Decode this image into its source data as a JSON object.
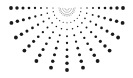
{
  "graphic": {
    "name": "half-sunburst-dot-pattern",
    "dot_color": "#1a1a1a",
    "center": [
      67,
      8
    ],
    "rays_count": 13,
    "angle_start_deg": 0,
    "angle_end_deg": 180,
    "dots_per_ray": 9,
    "radius_start": 8,
    "radius_end_horizontal": 56,
    "radius_end_vertical": 62,
    "dot_size_min": 0.4,
    "dot_size_max": 1.9
  }
}
